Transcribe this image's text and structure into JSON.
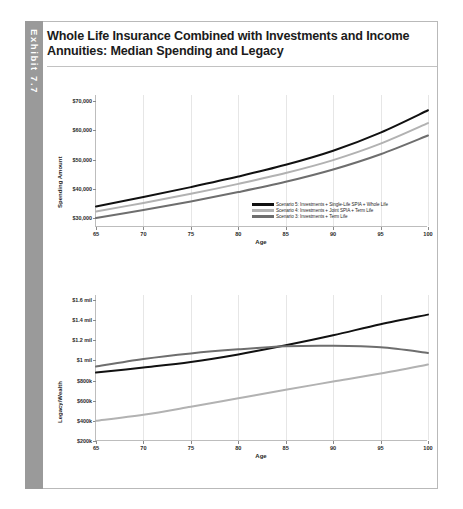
{
  "exhibit": {
    "tab_label": "Exhibit 7.7",
    "tab_color": "#9a9a9a",
    "title": "Whole Life Insurance Combined with Investments and Income Annuities: Median Spending and Legacy"
  },
  "series_colors": {
    "scenario5": "#111111",
    "scenario4": "#b2b2b2",
    "scenario3": "#6e6e6e"
  },
  "legend": {
    "items": [
      {
        "label": "Scenario 5: Investments + Single-Life SPIA + Whole Life",
        "color": "#111111"
      },
      {
        "label": "Scenario 4: Investments + Joint SPIA + Term Life",
        "color": "#b2b2b2"
      },
      {
        "label": "Scenario 3: Investments + Term Life",
        "color": "#6e6e6e"
      }
    ]
  },
  "chart_data": [
    {
      "type": "line",
      "id": "spending-chart",
      "title": "",
      "xlabel": "Age",
      "ylabel": "Spending Amount",
      "x": [
        65,
        70,
        75,
        80,
        85,
        90,
        95,
        100
      ],
      "xlim": [
        65,
        100
      ],
      "ylim": [
        27000,
        72000
      ],
      "xticks": [
        65,
        70,
        75,
        80,
        85,
        90,
        95,
        100
      ],
      "xtick_labels": [
        "65",
        "70",
        "75",
        "80",
        "85",
        "90",
        "95",
        "100"
      ],
      "yticks": [
        30000,
        40000,
        50000,
        60000,
        70000
      ],
      "ytick_labels": [
        "$30,000",
        "$40,000",
        "$50,000",
        "$60,000",
        "$70,000"
      ],
      "grid": "vertical",
      "legend_position": "inside-lower-right",
      "series": [
        {
          "name": "Scenario 5: Investments + Single-Life SPIA + Whole Life",
          "color": "#111111",
          "values": [
            34000,
            37200,
            40600,
            44200,
            48200,
            53000,
            59200,
            66800
          ]
        },
        {
          "name": "Scenario 4: Investments + Joint SPIA + Term Life",
          "color": "#b2b2b2",
          "values": [
            32300,
            35200,
            38300,
            41700,
            45400,
            49800,
            55400,
            62400
          ]
        },
        {
          "name": "Scenario 3: Investments + Term Life",
          "color": "#6e6e6e",
          "values": [
            30100,
            32800,
            35700,
            38900,
            42400,
            46600,
            51800,
            58200
          ]
        }
      ]
    },
    {
      "type": "line",
      "id": "legacy-chart",
      "title": "",
      "xlabel": "Age",
      "ylabel": "Legacy/Wealth",
      "x": [
        65,
        70,
        75,
        80,
        85,
        90,
        95,
        100
      ],
      "xlim": [
        65,
        100
      ],
      "ylim": [
        200000,
        1650000
      ],
      "xticks": [
        65,
        70,
        75,
        80,
        85,
        90,
        95,
        100
      ],
      "xtick_labels": [
        "65",
        "70",
        "75",
        "80",
        "85",
        "90",
        "95",
        "100"
      ],
      "yticks": [
        200000,
        400000,
        600000,
        800000,
        1000000,
        1200000,
        1400000,
        1600000
      ],
      "ytick_labels": [
        "$200k",
        "$400k",
        "$600k",
        "$800k",
        "$1 mil",
        "$1.2 mil",
        "$1.4 mil",
        "$1.6 mil"
      ],
      "grid": "vertical",
      "legend_position": "none",
      "series": [
        {
          "name": "Scenario 5: Investments + Single-Life SPIA + Whole Life",
          "color": "#111111",
          "values": [
            880000,
            930000,
            985000,
            1060000,
            1150000,
            1250000,
            1360000,
            1455000
          ]
        },
        {
          "name": "Scenario 3: Investments + Term Life",
          "color": "#6e6e6e",
          "values": [
            940000,
            1015000,
            1070000,
            1110000,
            1140000,
            1145000,
            1130000,
            1075000
          ]
        },
        {
          "name": "Scenario 4: Investments + Joint SPIA + Term Life",
          "color": "#b2b2b2",
          "values": [
            400000,
            460000,
            540000,
            625000,
            710000,
            790000,
            870000,
            960000
          ]
        }
      ]
    }
  ]
}
